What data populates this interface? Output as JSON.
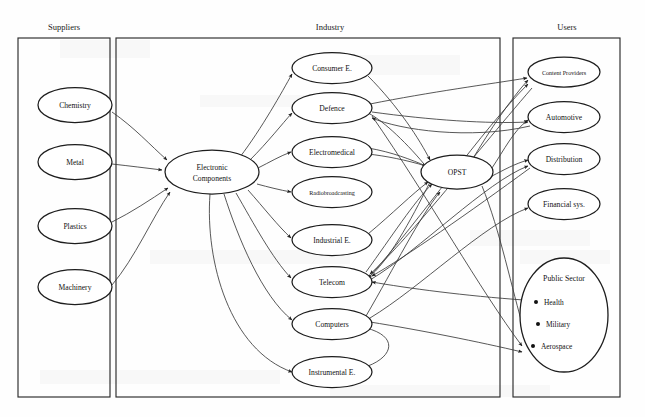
{
  "diagram": {
    "type": "value-chain-network",
    "background": "#fefefe",
    "edge_color": "#3a3a3a",
    "node_stroke": "#1d1d1d",
    "panels": [
      {
        "id": "suppliers",
        "label": "Suppliers",
        "x": 18,
        "y": 38,
        "w": 92,
        "h": 359,
        "title_x": 64,
        "title_y": 30
      },
      {
        "id": "industry",
        "label": "Industry",
        "x": 116,
        "y": 38,
        "w": 384,
        "h": 359,
        "title_x": 330,
        "title_y": 30
      },
      {
        "id": "users",
        "label": "Users",
        "x": 513,
        "y": 38,
        "w": 107,
        "h": 359,
        "title_x": 567,
        "title_y": 30
      }
    ],
    "nodes": [
      {
        "id": "chemistry",
        "label": "Chemistry",
        "panel": "suppliers",
        "cx": 75,
        "cy": 105,
        "rx": 37,
        "ry": 17.5,
        "style": "normal"
      },
      {
        "id": "metal",
        "label": "Metal",
        "panel": "suppliers",
        "cx": 75,
        "cy": 162,
        "rx": 37,
        "ry": 17.5,
        "style": "normal"
      },
      {
        "id": "plastics",
        "label": "Plastics",
        "panel": "suppliers",
        "cx": 75,
        "cy": 226,
        "rx": 37,
        "ry": 17.5,
        "style": "normal"
      },
      {
        "id": "machinery",
        "label": "Machinery",
        "panel": "suppliers",
        "cx": 75,
        "cy": 287,
        "rx": 37,
        "ry": 17.5,
        "style": "normal"
      },
      {
        "id": "electronic-components",
        "label": "Electronic Components",
        "panel": "industry",
        "cx": 212,
        "cy": 172,
        "rx": 47,
        "ry": 22,
        "style": "two-line",
        "line1": "Electronic",
        "line2": "Components"
      },
      {
        "id": "consumer-e",
        "label": "Consumer E.",
        "panel": "industry",
        "cx": 332,
        "cy": 68,
        "rx": 40,
        "ry": 15.5,
        "style": "normal"
      },
      {
        "id": "defence",
        "label": "Defence",
        "panel": "industry",
        "cx": 332,
        "cy": 108,
        "rx": 40,
        "ry": 15.5,
        "style": "normal"
      },
      {
        "id": "electromedical",
        "label": "Electromedical",
        "panel": "industry",
        "cx": 332,
        "cy": 152,
        "rx": 40,
        "ry": 15.5,
        "style": "normal"
      },
      {
        "id": "radiobroadcasting",
        "label": "Radiobroadcasting",
        "panel": "industry",
        "cx": 332,
        "cy": 192,
        "rx": 40,
        "ry": 15.5,
        "style": "small"
      },
      {
        "id": "industrial-e",
        "label": "Industrial E.",
        "panel": "industry",
        "cx": 332,
        "cy": 240,
        "rx": 40,
        "ry": 15.5,
        "style": "normal"
      },
      {
        "id": "telecom",
        "label": "Telecom",
        "panel": "industry",
        "cx": 332,
        "cy": 282,
        "rx": 40,
        "ry": 15.5,
        "style": "normal"
      },
      {
        "id": "computers",
        "label": "Computers",
        "panel": "industry",
        "cx": 332,
        "cy": 324,
        "rx": 40,
        "ry": 15.5,
        "style": "normal"
      },
      {
        "id": "instrumental-e",
        "label": "Instrumental E.",
        "panel": "industry",
        "cx": 332,
        "cy": 372,
        "rx": 40,
        "ry": 15.5,
        "style": "normal"
      },
      {
        "id": "opst",
        "label": "OPST",
        "panel": "industry",
        "cx": 457,
        "cy": 172,
        "rx": 36,
        "ry": 17,
        "style": "normal"
      },
      {
        "id": "content-providers",
        "label": "Content Providers",
        "panel": "users",
        "cx": 564,
        "cy": 72,
        "rx": 36,
        "ry": 15,
        "style": "small"
      },
      {
        "id": "automotive",
        "label": "Automotive",
        "panel": "users",
        "cx": 564,
        "cy": 117,
        "rx": 36,
        "ry": 15.5,
        "style": "normal"
      },
      {
        "id": "distribution",
        "label": "Distribution",
        "panel": "users",
        "cx": 564,
        "cy": 159,
        "rx": 36,
        "ry": 15.5,
        "style": "normal"
      },
      {
        "id": "financial-sys",
        "label": "Financial sys.",
        "panel": "users",
        "cx": 564,
        "cy": 204,
        "rx": 36,
        "ry": 15.5,
        "style": "normal"
      }
    ],
    "public_sector": {
      "id": "public-sector",
      "label": "Public Sector",
      "panel": "users",
      "cx": 564,
      "cy": 315,
      "rx": 44,
      "ry": 57,
      "label_y": 281,
      "bullets": [
        {
          "label": "Health",
          "x": 544,
          "y": 305,
          "dot_x": 536,
          "dot_y": 302
        },
        {
          "label": "Military",
          "x": 546,
          "y": 327,
          "dot_x": 538,
          "dot_y": 324
        },
        {
          "label": "Aerospace",
          "x": 541,
          "y": 349,
          "dot_x": 533,
          "dot_y": 346
        }
      ]
    },
    "edges": [
      {
        "from": "chemistry",
        "to": "electronic-components",
        "d": "M112,112 C135,128 150,145 167,160"
      },
      {
        "from": "metal",
        "to": "electronic-components",
        "d": "M112,164 C130,166 146,168 162,170"
      },
      {
        "from": "plastics",
        "to": "electronic-components",
        "d": "M112,222 C132,212 150,200 168,188"
      },
      {
        "from": "machinery",
        "to": "electronic-components",
        "d": "M112,285 C135,258 152,218 170,192"
      },
      {
        "from": "electronic-components",
        "to": "consumer-e",
        "d": "M240,157 C262,128 282,92 292,74"
      },
      {
        "from": "electronic-components",
        "to": "defence",
        "d": "M250,160 C268,142 282,124 292,113"
      },
      {
        "from": "electronic-components",
        "to": "electromedical",
        "d": "M258,168 C270,162 280,156 291,152"
      },
      {
        "from": "electronic-components",
        "to": "radiobroadcasting",
        "d": "M257,184 C268,187 280,190 291,192"
      },
      {
        "from": "electronic-components",
        "to": "industrial-e",
        "d": "M248,190 C264,208 278,226 291,238"
      },
      {
        "from": "electronic-components",
        "to": "telecom",
        "d": "M236,193 C254,224 272,258 291,278"
      },
      {
        "from": "electronic-components",
        "to": "computers",
        "d": "M224,194 C238,238 262,296 292,320"
      },
      {
        "from": "electronic-components",
        "to": "instrumental-e",
        "d": "M210,194 C205,262 230,350 292,372"
      },
      {
        "from": "consumer-e",
        "to": "opst",
        "d": "M368,76 C398,106 420,140 430,160"
      },
      {
        "from": "defence",
        "to": "distribution",
        "d": "M370,104 C430,92 490,84 527,78"
      },
      {
        "from": "electromedical",
        "to": "opst",
        "d": "M368,148 C392,152 412,160 426,166"
      },
      {
        "from": "industrial-e",
        "to": "opst",
        "d": "M368,234 C392,214 412,194 428,182"
      },
      {
        "from": "telecom",
        "to": "opst",
        "d": "M366,272 C392,236 414,202 432,184"
      },
      {
        "from": "computers",
        "to": "opst",
        "d": "M366,316 C394,268 420,216 440,192"
      },
      {
        "from": "instrumental-e",
        "to": "computers",
        "d": "M368,366 C394,356 398,336 366,328"
      },
      {
        "from": "opst",
        "to": "defence",
        "d": "M424,164 C404,140 380,118 366,112"
      },
      {
        "from": "opst",
        "to": "electromedical",
        "d": "M426,166 C406,160 386,156 368,154"
      },
      {
        "from": "opst",
        "to": "telecom",
        "d": "M430,182 C410,222 388,262 368,278"
      },
      {
        "from": "opst",
        "to": "content-providers",
        "d": "M472,160 C490,130 510,100 528,80"
      },
      {
        "from": "opst",
        "to": "automotive",
        "d": "M492,168 C504,150 514,130 528,120"
      },
      {
        "from": "opst",
        "to": "distribution",
        "d": "M492,176 C504,170 514,164 528,160"
      },
      {
        "from": "opst",
        "to": "public-sector",
        "d": "M482,186 C500,230 512,290 524,330"
      },
      {
        "from": "defence",
        "to": "automotive",
        "d": "M372,112 C430,120 488,124 528,122"
      },
      {
        "from": "defence",
        "to": "public-sector",
        "d": "M372,116 C430,200 480,290 522,346"
      },
      {
        "from": "telecom",
        "to": "content-providers",
        "d": "M370,276 C420,220 482,130 528,84"
      },
      {
        "from": "telecom",
        "to": "distribution",
        "d": "M370,280 C420,250 486,182 528,166"
      },
      {
        "from": "computers",
        "to": "public-sector",
        "d": "M370,322 C420,330 480,342 522,352"
      },
      {
        "from": "computers",
        "to": "financial-sys",
        "d": "M370,318 C420,288 484,224 528,208"
      },
      {
        "from": "content-providers",
        "to": "telecom",
        "d": "M532,88 C470,160 404,244 370,274"
      },
      {
        "from": "automotive",
        "to": "defence",
        "d": "M530,126 C470,140 400,130 372,118"
      },
      {
        "from": "distribution",
        "to": "telecom",
        "d": "M530,168 C470,212 404,258 372,276"
      },
      {
        "from": "public-sector",
        "to": "telecom",
        "d": "M524,300 C466,296 406,288 372,282"
      }
    ]
  }
}
